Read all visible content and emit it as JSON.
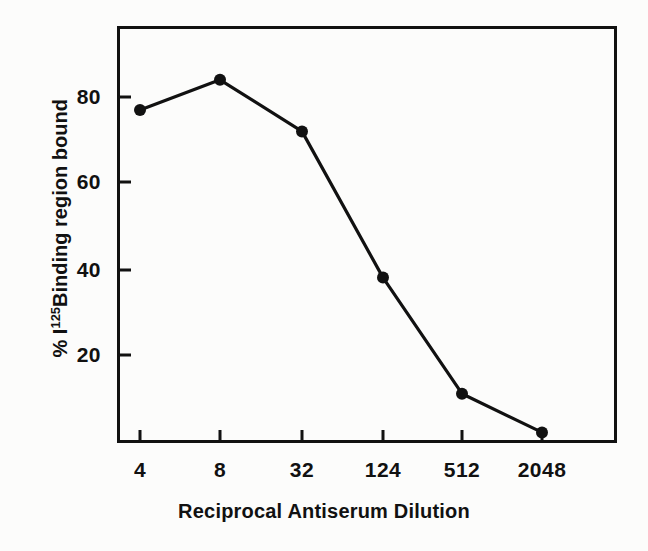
{
  "chart_data": {
    "type": "line",
    "title": "",
    "xlabel": "Reciprocal Antiserum Dilution",
    "ylabel_parts": {
      "percent": "%",
      "element": "I",
      "superscript": "125",
      "rest": "Binding region bound"
    },
    "ylabel": "% I125 Binding region bound",
    "categories": [
      "4",
      "8",
      "32",
      "124",
      "512",
      "2048"
    ],
    "values": [
      77,
      84,
      72,
      38,
      11,
      2
    ],
    "series": [
      {
        "name": "Binding region bound",
        "values": [
          77,
          84,
          72,
          38,
          11,
          2
        ]
      }
    ],
    "xticks": [
      "4",
      "8",
      "32",
      "124",
      "512",
      "2048"
    ],
    "yticks": [
      "20",
      "40",
      "60",
      "80"
    ],
    "ytick_values": [
      20,
      40,
      60,
      80
    ],
    "ylim": [
      0,
      97
    ],
    "grid": false,
    "legend": false,
    "marker": "filled-circle",
    "line_color": "#111111",
    "marker_color": "#111111",
    "background_color": "#fcfcfb",
    "frame_color": "#111111"
  },
  "figure": {
    "xaxis_title": "Reciprocal Antiserum Dilution"
  }
}
